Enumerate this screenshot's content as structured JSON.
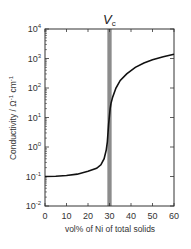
{
  "chart_data": {
    "type": "line",
    "annotation": {
      "label": "V",
      "subscript": "c",
      "x_band": [
        29,
        31
      ]
    },
    "xlabel": "vol% of Ni of total solids",
    "ylabel": "Conductivity / Ω⁻¹ cm⁻¹",
    "xlim": [
      0,
      60
    ],
    "ylim_log10": [
      -2,
      4
    ],
    "yscale": "log",
    "x_ticks": [
      0,
      10,
      20,
      30,
      40,
      50,
      60
    ],
    "y_ticks_exp": [
      -2,
      -1,
      0,
      1,
      2,
      3,
      4
    ],
    "grid": false,
    "series": [
      {
        "name": "conductivity",
        "x": [
          0,
          5,
          10,
          15,
          20,
          24,
          26,
          27.5,
          28.5,
          29,
          29.3,
          29.6,
          30,
          30.3,
          30.7,
          31.5,
          33,
          35,
          38,
          42,
          46,
          50,
          55,
          60
        ],
        "y": [
          0.1,
          0.102,
          0.108,
          0.12,
          0.15,
          0.19,
          0.25,
          0.4,
          0.8,
          1.5,
          3,
          6,
          12,
          20,
          30,
          50,
          100,
          180,
          300,
          500,
          700,
          900,
          1150,
          1400
        ]
      }
    ]
  },
  "labels": {
    "vc_main": "V",
    "vc_sub": "c",
    "xlabel": "vol% of Ni of total solids",
    "ylabel_main": "Conductivity / Ω",
    "ylabel_sup1": "-1",
    "ylabel_mid": " cm",
    "ylabel_sup2": "-1",
    "y_tick_base": "10",
    "x_ticks": [
      "0",
      "10",
      "20",
      "30",
      "40",
      "50",
      "60"
    ],
    "y_exps": [
      "-2",
      "-1",
      "0",
      "1",
      "2",
      "3",
      "4"
    ]
  },
  "colors": {
    "line": "#111111",
    "band": "#8c8c8c",
    "axis": "#333333"
  }
}
